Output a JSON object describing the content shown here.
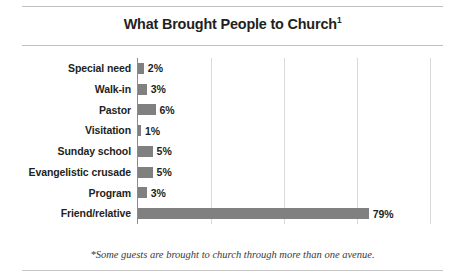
{
  "figure": {
    "title": "What Brought People to Church",
    "title_superscript": "1",
    "footnote": "*Some guests are brought to church through more than one avenue."
  },
  "colors": {
    "bar": "#808080",
    "axis": "#8c8c8c",
    "gridline": "#d9d9d9",
    "rule": "#bfbfbf",
    "text": "#231f20"
  },
  "chart_data": {
    "type": "bar",
    "orientation": "horizontal",
    "title": "What Brought People to Church",
    "xlabel": "",
    "ylabel": "",
    "xlim": [
      0,
      100
    ],
    "grid": true,
    "legend": false,
    "xticks": [
      "0%",
      "25%",
      "50%",
      "75%",
      "100%"
    ],
    "xtick_values": [
      0,
      25,
      50,
      75,
      100
    ],
    "categories": [
      "Special need",
      "Walk-in",
      "Pastor",
      "Visitation",
      "Sunday school",
      "Evangelistic crusade",
      "Program",
      "Friend/relative"
    ],
    "values": [
      2,
      3,
      6,
      1,
      5,
      5,
      3,
      79
    ],
    "value_labels": [
      "2%",
      "3%",
      "6%",
      "1%",
      "5%",
      "5%",
      "3%",
      "79%"
    ]
  }
}
